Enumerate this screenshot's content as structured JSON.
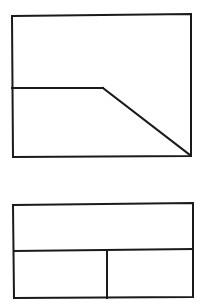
{
  "diagram": {
    "type": "orthographic-projection",
    "stroke_color": "#1a1a1a",
    "background_color": "#ffffff",
    "views": [
      {
        "name": "front-view",
        "outline": {
          "x1": 12,
          "y1": 15,
          "x2": 191,
          "y2": 156
        },
        "inner_lines": [
          {
            "name": "horizontal-edge",
            "points": [
              [
                12,
                88
              ],
              [
                103,
                88
              ]
            ]
          },
          {
            "name": "chamfer-edge",
            "points": [
              [
                103,
                88
              ],
              [
                191,
                156
              ]
            ]
          }
        ]
      },
      {
        "name": "top-view",
        "outline": {
          "x1": 13,
          "y1": 204,
          "x2": 193,
          "y2": 298
        },
        "inner_lines": [
          {
            "name": "horizontal-divider",
            "points": [
              [
                13,
                250
              ],
              [
                193,
                249
              ]
            ]
          },
          {
            "name": "vertical-divider",
            "points": [
              [
                107,
                250
              ],
              [
                107,
                298
              ]
            ]
          }
        ]
      }
    ]
  }
}
